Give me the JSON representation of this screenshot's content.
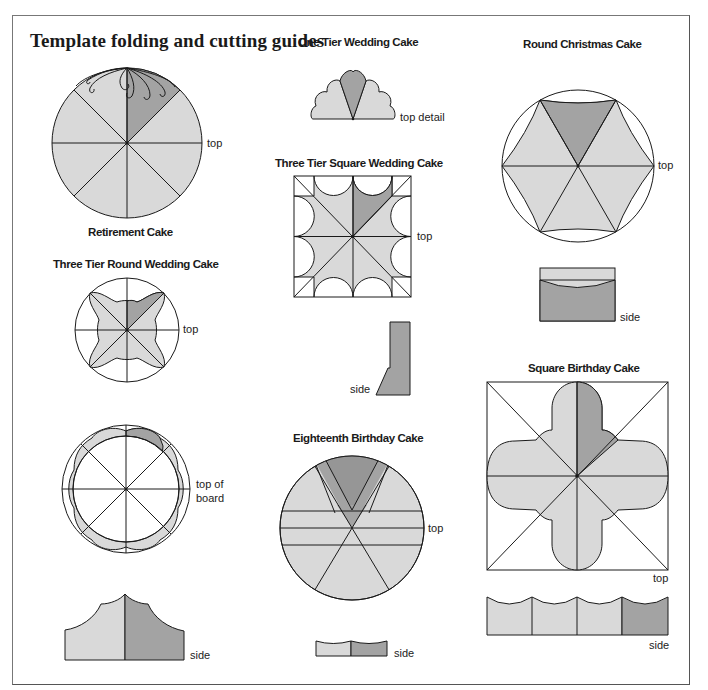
{
  "page": {
    "title": "Template folding and cutting guides"
  },
  "colors": {
    "light_fill": "#d9d9d9",
    "dark_fill": "#a3a3a3",
    "line": "#1a1a1a"
  },
  "diagrams": [
    {
      "name": "Retirement Cake",
      "notes": [
        "top"
      ]
    },
    {
      "name": "One Tier Wedding Cake",
      "notes": [
        "top detail"
      ]
    },
    {
      "name": "Three Tier Square Wedding Cake",
      "notes": [
        "top",
        "side"
      ]
    },
    {
      "name": "Round Christmas Cake",
      "notes": [
        "top",
        "side"
      ]
    },
    {
      "name": "Three Tier Round Wedding Cake",
      "notes": [
        "top",
        "top of board",
        "side"
      ]
    },
    {
      "name": "Eighteenth Birthday Cake",
      "notes": [
        "top",
        "side"
      ]
    },
    {
      "name": "Square Birthday Cake",
      "notes": [
        "top",
        "side"
      ]
    }
  ],
  "labels": {
    "retirement": "Retirement Cake",
    "one_tier": "One Tier Wedding Cake",
    "three_tier_square": "Three Tier Square Wedding Cake",
    "christmas": "Round Christmas Cake",
    "three_tier_round": "Three Tier Round Wedding Cake",
    "eighteenth": "Eighteenth Birthday Cake",
    "square_birthday": "Square Birthday Cake"
  },
  "notes": {
    "top": "top",
    "top_detail": "top detail",
    "side": "side",
    "top_of_board_1": "top of",
    "top_of_board_2": "board"
  }
}
